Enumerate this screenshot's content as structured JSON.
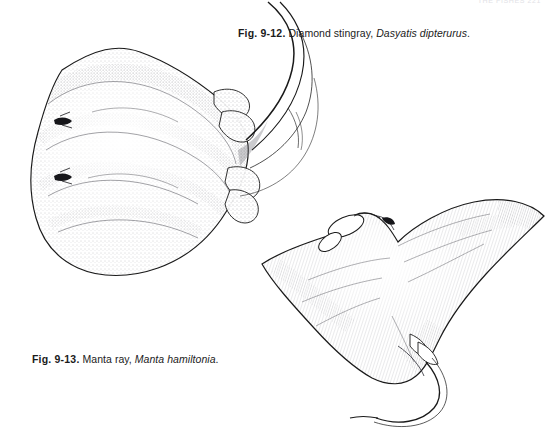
{
  "page": {
    "background_color": "#ffffff",
    "width": 553,
    "height": 430,
    "running_head": "THE FISHES  221"
  },
  "figures": [
    {
      "id": "fig-9-12",
      "number": "Fig. 9-12.",
      "common_name": " Diamond stingray, ",
      "scientific_name": "Dasyatis dipterurus",
      "terminal": ".",
      "subject": "diamond-stingray",
      "art_style": "stippled pen-and-ink line drawing",
      "ink_color": "#1a1a1a",
      "caption_position": "top-right"
    },
    {
      "id": "fig-9-13",
      "number": "Fig. 9-13.",
      "common_name": " Manta ray, ",
      "scientific_name": "Manta hamiltonia",
      "terminal": ".",
      "subject": "manta-ray",
      "art_style": "stippled pen-and-ink line drawing",
      "ink_color": "#1a1a1a",
      "caption_position": "bottom-left"
    }
  ]
}
